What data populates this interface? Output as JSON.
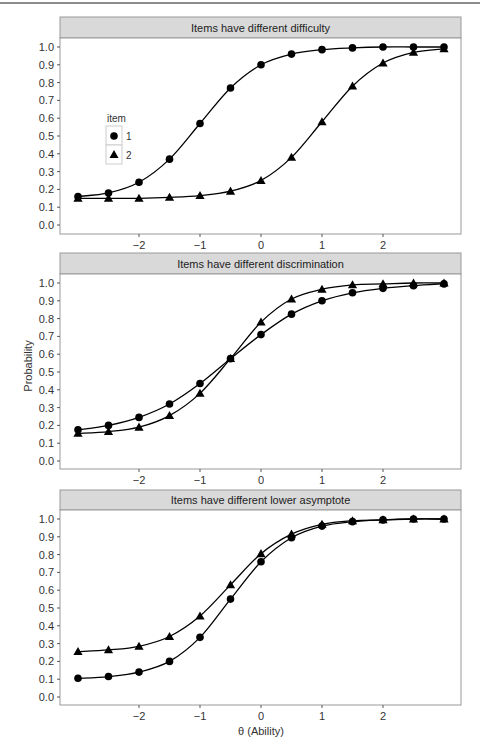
{
  "figure": {
    "ylabel": "Probability",
    "xlabel": "θ (Ability)",
    "legend": {
      "title": "item",
      "entries": [
        {
          "label": "1",
          "shape": "circle"
        },
        {
          "label": "2",
          "shape": "triangle"
        }
      ]
    },
    "colors": {
      "strip_bg": "#d9d9d9",
      "panel_border": "#999999",
      "line": "#000000",
      "marker": "#000000"
    }
  },
  "chart_data": [
    {
      "type": "line",
      "title": "Items have different difficulty",
      "xlabel": "θ (Ability)",
      "ylabel": "Probability",
      "x_ticks": [
        -2,
        -1,
        0,
        1,
        2
      ],
      "y_ticks": [
        0.0,
        0.1,
        0.2,
        0.3,
        0.4,
        0.5,
        0.6,
        0.7,
        0.8,
        0.9,
        1.0
      ],
      "ylim": [
        0.0,
        1.0
      ],
      "grid": false,
      "legend_position": "inside-left",
      "x": [
        -3,
        -2.5,
        -2,
        -1.5,
        -1,
        -0.5,
        0,
        0.5,
        1,
        1.5,
        2,
        2.5,
        3
      ],
      "series": [
        {
          "name": "1",
          "marker": "circle",
          "values": [
            0.16,
            0.18,
            0.24,
            0.37,
            0.57,
            0.77,
            0.9,
            0.96,
            0.985,
            0.995,
            1.0,
            1.0,
            1.0
          ]
        },
        {
          "name": "2",
          "marker": "triangle",
          "values": [
            0.15,
            0.15,
            0.15,
            0.155,
            0.165,
            0.19,
            0.25,
            0.38,
            0.58,
            0.78,
            0.91,
            0.97,
            0.99
          ]
        }
      ]
    },
    {
      "type": "line",
      "title": "Items have different discrimination",
      "xlabel": "θ (Ability)",
      "ylabel": "Probability",
      "x_ticks": [
        -2,
        -1,
        0,
        1,
        2
      ],
      "y_ticks": [
        0.0,
        0.1,
        0.2,
        0.3,
        0.4,
        0.5,
        0.6,
        0.7,
        0.8,
        0.9,
        1.0
      ],
      "ylim": [
        0.0,
        1.0
      ],
      "grid": false,
      "x": [
        -3,
        -2.5,
        -2,
        -1.5,
        -1,
        -0.5,
        0,
        0.5,
        1,
        1.5,
        2,
        2.5,
        3
      ],
      "series": [
        {
          "name": "1",
          "marker": "circle",
          "values": [
            0.175,
            0.2,
            0.245,
            0.32,
            0.435,
            0.575,
            0.71,
            0.825,
            0.9,
            0.945,
            0.97,
            0.985,
            0.995
          ]
        },
        {
          "name": "2",
          "marker": "triangle",
          "values": [
            0.155,
            0.165,
            0.19,
            0.255,
            0.38,
            0.575,
            0.78,
            0.91,
            0.965,
            0.99,
            0.995,
            1.0,
            1.0
          ]
        }
      ]
    },
    {
      "type": "line",
      "title": "Items have different lower asymptote",
      "xlabel": "θ (Ability)",
      "ylabel": "Probability",
      "x_ticks": [
        -2,
        -1,
        0,
        1,
        2
      ],
      "y_ticks": [
        0.0,
        0.1,
        0.2,
        0.3,
        0.4,
        0.5,
        0.6,
        0.7,
        0.8,
        0.9,
        1.0
      ],
      "ylim": [
        0.0,
        1.0
      ],
      "grid": false,
      "x": [
        -3,
        -2.5,
        -2,
        -1.5,
        -1,
        -0.5,
        0,
        0.5,
        1,
        1.5,
        2,
        2.5,
        3
      ],
      "series": [
        {
          "name": "1",
          "marker": "circle",
          "values": [
            0.105,
            0.115,
            0.14,
            0.2,
            0.335,
            0.55,
            0.76,
            0.895,
            0.96,
            0.985,
            0.995,
            1.0,
            1.0
          ]
        },
        {
          "name": "2",
          "marker": "triangle",
          "values": [
            0.255,
            0.265,
            0.285,
            0.34,
            0.455,
            0.63,
            0.805,
            0.915,
            0.97,
            0.99,
            0.995,
            1.0,
            1.0
          ]
        }
      ]
    }
  ]
}
